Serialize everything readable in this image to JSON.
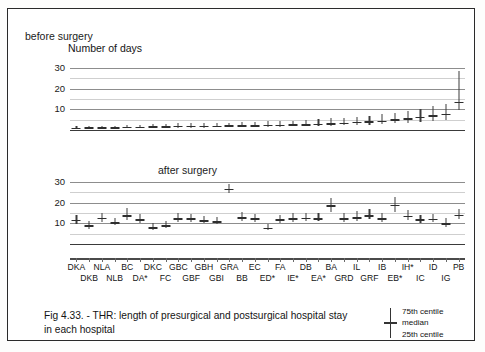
{
  "figure": {
    "caption_line1": "Fig 4.33. - THR: length of presurgical and postsurgical hospital stay",
    "caption_line2": "in each hospital",
    "axis_title": "Number of days",
    "panel_a_label": "before surgery",
    "panel_b_label": "after surgery"
  },
  "legend": {
    "upper": "75th centile",
    "middle": "median",
    "lower": "25th centile"
  },
  "chart_data": {
    "type": "line",
    "title": "Fig 4.33. - THR: length of presurgical and postsurgical hospital stay in each hospital",
    "xlabel": "",
    "ylabel": "Number of days",
    "grid": true,
    "legend_position": "bottom-right",
    "yticks": [
      10,
      20,
      30
    ],
    "ylim": [
      0,
      33
    ],
    "categories": [
      "DKA",
      "DKB",
      "NLA",
      "NLB",
      "BC",
      "DA*",
      "DKC",
      "FC",
      "GBC",
      "GBF",
      "GBH",
      "GBI",
      "GRA",
      "BB",
      "EC",
      "ED*",
      "FA",
      "IE*",
      "DB",
      "EA*",
      "BA",
      "GRD",
      "IL",
      "GRF",
      "IB",
      "EB*",
      "IH*",
      "IC",
      "ID",
      "IG",
      "PB"
    ],
    "panels": [
      {
        "name": "before surgery",
        "ylim": [
          0,
          33
        ],
        "yticks": [
          10,
          20,
          30
        ],
        "series": [
          {
            "name": "presurgical stay (days)",
            "median": [
              1.2,
              1.3,
              1.3,
              1.4,
              1.5,
              1.6,
              1.8,
              1.9,
              2.0,
              2.0,
              2.1,
              2.1,
              2.2,
              2.3,
              2.4,
              2.5,
              2.6,
              2.7,
              2.9,
              3.1,
              3.3,
              3.6,
              3.9,
              4.2,
              4.6,
              5.2,
              5.8,
              6.4,
              7.2,
              8.0,
              13.8
            ],
            "p25": [
              1.0,
              1.0,
              1.0,
              1.0,
              1.0,
              1.0,
              1.1,
              1.1,
              1.2,
              1.2,
              1.2,
              1.3,
              1.3,
              1.4,
              1.4,
              1.5,
              1.6,
              1.7,
              1.8,
              1.9,
              2.0,
              2.2,
              2.4,
              2.6,
              2.9,
              3.2,
              3.6,
              4.0,
              4.4,
              5.0,
              9.8
            ],
            "p75": [
              1.8,
              1.9,
              2.0,
              2.1,
              2.3,
              2.5,
              2.8,
              3.0,
              3.2,
              3.3,
              3.4,
              3.5,
              3.6,
              3.8,
              4.0,
              4.2,
              4.4,
              4.6,
              4.9,
              5.2,
              5.6,
              6.0,
              6.5,
              7.0,
              7.6,
              8.3,
              9.2,
              10.4,
              11.5,
              12.6,
              28.8
            ]
          }
        ]
      },
      {
        "name": "after surgery",
        "ylim": [
          0,
          33
        ],
        "yticks": [
          10,
          20,
          30
        ],
        "series": [
          {
            "name": "postsurgical stay (days)",
            "median": [
              11.8,
              9.0,
              12.8,
              10.5,
              14.0,
              12.0,
              8.2,
              9.0,
              12.6,
              12.4,
              11.6,
              11.0,
              26.8,
              13.0,
              12.4,
              8.0,
              11.9,
              12.6,
              12.8,
              12.5,
              18.8,
              12.6,
              13.0,
              14.0,
              12.5,
              19.0,
              13.8,
              11.9,
              12.3,
              10.0,
              14.2
            ],
            "p25": [
              9.8,
              7.2,
              10.8,
              9.0,
              11.8,
              10.2,
              6.8,
              7.6,
              10.6,
              10.8,
              10.0,
              9.6,
              24.6,
              11.2,
              10.8,
              6.8,
              10.2,
              10.8,
              11.0,
              11.0,
              15.6,
              10.8,
              11.2,
              12.0,
              10.8,
              15.6,
              11.6,
              10.2,
              10.6,
              8.4,
              12.0
            ],
            "p75": [
              14.0,
              11.0,
              15.2,
              12.4,
              17.6,
              14.4,
              10.0,
              11.2,
              15.0,
              14.6,
              13.6,
              13.0,
              29.0,
              15.4,
              14.8,
              9.8,
              14.2,
              15.2,
              15.0,
              15.0,
              22.4,
              15.2,
              15.8,
              17.0,
              15.0,
              23.0,
              16.4,
              14.0,
              14.6,
              12.4,
              17.0
            ]
          }
        ]
      }
    ]
  }
}
